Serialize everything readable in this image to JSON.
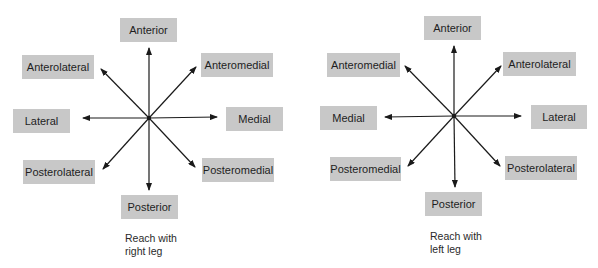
{
  "diagrams": [
    {
      "id": "right-leg",
      "center": {
        "x": 149,
        "y": 118
      },
      "labels": {
        "anterior": "Anterior",
        "upper_left": "Anterolateral",
        "upper_right": "Anteromedial",
        "left": "Lateral",
        "right": "Medial",
        "lower_left": "Posterolateral",
        "lower_right": "Posteromedial",
        "posterior": "Posterior"
      },
      "caption": {
        "line1": "Reach with",
        "line2": "right leg"
      }
    },
    {
      "id": "left-leg",
      "center": {
        "x": 155,
        "y": 116
      },
      "labels": {
        "anterior": "Anterior",
        "upper_left": "Anteromedial",
        "upper_right": "Anterolateral",
        "left": "Medial",
        "right": "Lateral",
        "lower_left": "Posteromedial",
        "lower_right": "Posterolateral",
        "posterior": "Posterior"
      },
      "caption": {
        "line1": "Reach with",
        "line2": "left leg"
      }
    }
  ],
  "colors": {
    "label_box": "#c8c8c8",
    "arrow": "#1a1a1a",
    "background": "#ffffff"
  }
}
